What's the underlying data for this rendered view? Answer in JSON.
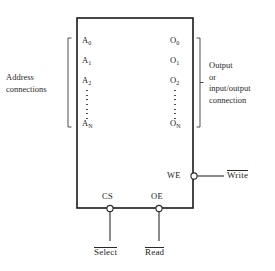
{
  "diagram": {
    "colors": {
      "background": "#ffffff",
      "outline": "#1a1a1a",
      "text": "#242424",
      "wire": "#2a2a2a"
    },
    "chip_body": {
      "name": "memory-chip-body",
      "x": 77,
      "y": 18,
      "width": 116,
      "height": 190
    }
  },
  "address_side": {
    "caption_line1": "Address",
    "caption_line2": "connections",
    "bracket_name": "address-bracket",
    "pins": [
      {
        "base": "A",
        "sub": "0"
      },
      {
        "base": "A",
        "sub": "1"
      },
      {
        "base": "A",
        "sub": "2"
      },
      {
        "base": "A",
        "sub": "N"
      }
    ],
    "ellipsis": "vertical-dots"
  },
  "output_side": {
    "caption_line1": "Output",
    "caption_line2": "or",
    "caption_line3": "input/output",
    "caption_line4": "connection",
    "bracket_name": "output-bracket",
    "pins": [
      {
        "base": "O",
        "sub": "0"
      },
      {
        "base": "O",
        "sub": "1"
      },
      {
        "base": "O",
        "sub": "2"
      },
      {
        "base": "O",
        "sub": "N"
      }
    ],
    "ellipsis": "vertical-dots"
  },
  "control_pins": {
    "write_enable": {
      "inner_label": "WE",
      "external_label": "Write",
      "active_low": true,
      "bubble": "inversion-bubble",
      "side": "right"
    },
    "chip_select": {
      "inner_label": "CS",
      "external_label": "Select",
      "active_low": true,
      "bubble": "inversion-bubble",
      "side": "bottom"
    },
    "output_enable": {
      "inner_label": "OE",
      "external_label": "Read",
      "active_low": true,
      "bubble": "inversion-bubble",
      "side": "bottom"
    }
  }
}
